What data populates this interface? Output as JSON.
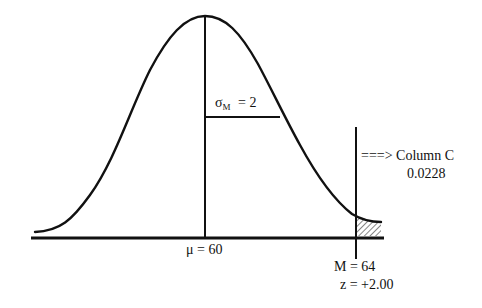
{
  "diagram": {
    "type": "normal-distribution",
    "mean_label": "μ = 60",
    "sigma": {
      "symbol": "σ",
      "subscript": "M",
      "value_text": " = 2"
    },
    "sample_mean_label": "M = 64",
    "z_label": "z = +2.00",
    "arrow_text": "===> Column C",
    "tail_proportion": "0.0228",
    "colors": {
      "stroke": "#111111",
      "background": "#ffffff",
      "hatch": "#333333"
    }
  }
}
